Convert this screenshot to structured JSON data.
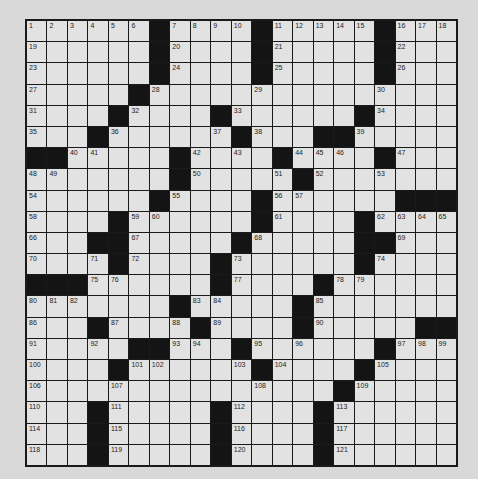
{
  "puzzle": {
    "rows": 21,
    "cols": 21,
    "colors": {
      "background": "#d9d9d9",
      "cell": "#e2e2e2",
      "block": "#141414",
      "line": "#1a1a1a",
      "number": "#222222"
    },
    "black_cells": {
      "0": [
        6,
        11,
        17
      ],
      "1": [
        6,
        11,
        17
      ],
      "2": [
        6,
        11,
        17
      ],
      "3": [
        5
      ],
      "4": [
        4,
        9,
        16
      ],
      "5": [
        3,
        10,
        14,
        15
      ],
      "6": [
        0,
        1,
        7,
        12,
        17
      ],
      "7": [
        7,
        13
      ],
      "8": [
        6,
        11,
        18,
        19,
        20
      ],
      "9": [
        4,
        11,
        16
      ],
      "10": [
        3,
        4,
        10,
        16,
        17
      ],
      "11": [
        4,
        9,
        16
      ],
      "12": [
        0,
        1,
        2,
        9,
        14
      ],
      "13": [
        7,
        13
      ],
      "14": [
        3,
        8,
        13,
        19,
        20
      ],
      "15": [
        5,
        6,
        10,
        17
      ],
      "16": [
        4,
        11,
        16
      ],
      "17": [
        15
      ],
      "18": [
        3,
        9,
        14
      ],
      "19": [
        3,
        9,
        14
      ],
      "20": [
        3,
        9,
        14
      ]
    },
    "numbers": [
      {
        "r": 0,
        "c": 0,
        "n": 1
      },
      {
        "r": 0,
        "c": 1,
        "n": 2
      },
      {
        "r": 0,
        "c": 2,
        "n": 3
      },
      {
        "r": 0,
        "c": 3,
        "n": 4
      },
      {
        "r": 0,
        "c": 4,
        "n": 5
      },
      {
        "r": 0,
        "c": 5,
        "n": 6
      },
      {
        "r": 0,
        "c": 7,
        "n": 7
      },
      {
        "r": 0,
        "c": 8,
        "n": 8
      },
      {
        "r": 0,
        "c": 9,
        "n": 9
      },
      {
        "r": 0,
        "c": 10,
        "n": 10
      },
      {
        "r": 0,
        "c": 12,
        "n": 11
      },
      {
        "r": 0,
        "c": 13,
        "n": 12
      },
      {
        "r": 0,
        "c": 14,
        "n": 13
      },
      {
        "r": 0,
        "c": 15,
        "n": 14
      },
      {
        "r": 0,
        "c": 16,
        "n": 15
      },
      {
        "r": 0,
        "c": 18,
        "n": 16
      },
      {
        "r": 0,
        "c": 19,
        "n": 17
      },
      {
        "r": 0,
        "c": 20,
        "n": 18
      },
      {
        "r": 1,
        "c": 0,
        "n": 19
      },
      {
        "r": 1,
        "c": 7,
        "n": 20
      },
      {
        "r": 1,
        "c": 12,
        "n": 21
      },
      {
        "r": 1,
        "c": 18,
        "n": 22
      },
      {
        "r": 2,
        "c": 0,
        "n": 23
      },
      {
        "r": 2,
        "c": 7,
        "n": 24
      },
      {
        "r": 2,
        "c": 12,
        "n": 25
      },
      {
        "r": 2,
        "c": 18,
        "n": 26
      },
      {
        "r": 3,
        "c": 0,
        "n": 27
      },
      {
        "r": 3,
        "c": 6,
        "n": 28
      },
      {
        "r": 3,
        "c": 11,
        "n": 29
      },
      {
        "r": 3,
        "c": 17,
        "n": 30
      },
      {
        "r": 4,
        "c": 0,
        "n": 31
      },
      {
        "r": 4,
        "c": 5,
        "n": 32
      },
      {
        "r": 4,
        "c": 10,
        "n": 33
      },
      {
        "r": 4,
        "c": 17,
        "n": 34
      },
      {
        "r": 5,
        "c": 0,
        "n": 35
      },
      {
        "r": 5,
        "c": 4,
        "n": 36
      },
      {
        "r": 5,
        "c": 9,
        "n": 37
      },
      {
        "r": 5,
        "c": 11,
        "n": 38
      },
      {
        "r": 5,
        "c": 16,
        "n": 39
      },
      {
        "r": 6,
        "c": 2,
        "n": 40
      },
      {
        "r": 6,
        "c": 3,
        "n": 41
      },
      {
        "r": 6,
        "c": 8,
        "n": 42
      },
      {
        "r": 6,
        "c": 10,
        "n": 43
      },
      {
        "r": 6,
        "c": 13,
        "n": 44
      },
      {
        "r": 6,
        "c": 14,
        "n": 45
      },
      {
        "r": 6,
        "c": 15,
        "n": 46
      },
      {
        "r": 6,
        "c": 18,
        "n": 47
      },
      {
        "r": 7,
        "c": 0,
        "n": 48
      },
      {
        "r": 7,
        "c": 1,
        "n": 49
      },
      {
        "r": 7,
        "c": 8,
        "n": 50
      },
      {
        "r": 7,
        "c": 12,
        "n": 51
      },
      {
        "r": 7,
        "c": 14,
        "n": 52
      },
      {
        "r": 7,
        "c": 17,
        "n": 53
      },
      {
        "r": 8,
        "c": 0,
        "n": 54
      },
      {
        "r": 8,
        "c": 7,
        "n": 55
      },
      {
        "r": 8,
        "c": 12,
        "n": 56
      },
      {
        "r": 8,
        "c": 13,
        "n": 57
      },
      {
        "r": 9,
        "c": 0,
        "n": 58
      },
      {
        "r": 9,
        "c": 5,
        "n": 59
      },
      {
        "r": 9,
        "c": 6,
        "n": 60
      },
      {
        "r": 9,
        "c": 12,
        "n": 61
      },
      {
        "r": 9,
        "c": 17,
        "n": 62
      },
      {
        "r": 9,
        "c": 18,
        "n": 63
      },
      {
        "r": 9,
        "c": 19,
        "n": 64
      },
      {
        "r": 9,
        "c": 20,
        "n": 65
      },
      {
        "r": 10,
        "c": 0,
        "n": 66
      },
      {
        "r": 10,
        "c": 5,
        "n": 67
      },
      {
        "r": 10,
        "c": 11,
        "n": 68
      },
      {
        "r": 10,
        "c": 18,
        "n": 69
      },
      {
        "r": 11,
        "c": 0,
        "n": 70
      },
      {
        "r": 11,
        "c": 3,
        "n": 71
      },
      {
        "r": 11,
        "c": 5,
        "n": 72
      },
      {
        "r": 11,
        "c": 10,
        "n": 73
      },
      {
        "r": 11,
        "c": 17,
        "n": 74
      },
      {
        "r": 12,
        "c": 3,
        "n": 75
      },
      {
        "r": 12,
        "c": 4,
        "n": 76
      },
      {
        "r": 12,
        "c": 10,
        "n": 77
      },
      {
        "r": 12,
        "c": 15,
        "n": 78
      },
      {
        "r": 12,
        "c": 16,
        "n": 79
      },
      {
        "r": 13,
        "c": 0,
        "n": 80
      },
      {
        "r": 13,
        "c": 1,
        "n": 81
      },
      {
        "r": 13,
        "c": 2,
        "n": 82
      },
      {
        "r": 13,
        "c": 8,
        "n": 83
      },
      {
        "r": 13,
        "c": 9,
        "n": 84
      },
      {
        "r": 13,
        "c": 14,
        "n": 85
      },
      {
        "r": 14,
        "c": 0,
        "n": 86
      },
      {
        "r": 14,
        "c": 4,
        "n": 87
      },
      {
        "r": 14,
        "c": 7,
        "n": 88
      },
      {
        "r": 14,
        "c": 9,
        "n": 89
      },
      {
        "r": 14,
        "c": 14,
        "n": 90
      },
      {
        "r": 15,
        "c": 0,
        "n": 91
      },
      {
        "r": 15,
        "c": 3,
        "n": 92
      },
      {
        "r": 15,
        "c": 7,
        "n": 93
      },
      {
        "r": 15,
        "c": 8,
        "n": 94
      },
      {
        "r": 15,
        "c": 11,
        "n": 95
      },
      {
        "r": 15,
        "c": 13,
        "n": 96
      },
      {
        "r": 15,
        "c": 18,
        "n": 97
      },
      {
        "r": 15,
        "c": 19,
        "n": 98
      },
      {
        "r": 15,
        "c": 20,
        "n": 99
      },
      {
        "r": 16,
        "c": 0,
        "n": 100
      },
      {
        "r": 16,
        "c": 5,
        "n": 101
      },
      {
        "r": 16,
        "c": 6,
        "n": 102
      },
      {
        "r": 16,
        "c": 10,
        "n": 103
      },
      {
        "r": 16,
        "c": 12,
        "n": 104
      },
      {
        "r": 16,
        "c": 17,
        "n": 105
      },
      {
        "r": 17,
        "c": 0,
        "n": 106
      },
      {
        "r": 17,
        "c": 4,
        "n": 107
      },
      {
        "r": 17,
        "c": 11,
        "n": 108
      },
      {
        "r": 17,
        "c": 16,
        "n": 109
      },
      {
        "r": 18,
        "c": 0,
        "n": 110
      },
      {
        "r": 18,
        "c": 4,
        "n": 111
      },
      {
        "r": 18,
        "c": 10,
        "n": 112
      },
      {
        "r": 18,
        "c": 15,
        "n": 113
      },
      {
        "r": 19,
        "c": 0,
        "n": 114
      },
      {
        "r": 19,
        "c": 4,
        "n": 115
      },
      {
        "r": 19,
        "c": 10,
        "n": 116
      },
      {
        "r": 19,
        "c": 15,
        "n": 117
      },
      {
        "r": 20,
        "c": 0,
        "n": 118
      },
      {
        "r": 20,
        "c": 4,
        "n": 119
      },
      {
        "r": 20,
        "c": 10,
        "n": 120
      },
      {
        "r": 20,
        "c": 15,
        "n": 121
      }
    ]
  }
}
